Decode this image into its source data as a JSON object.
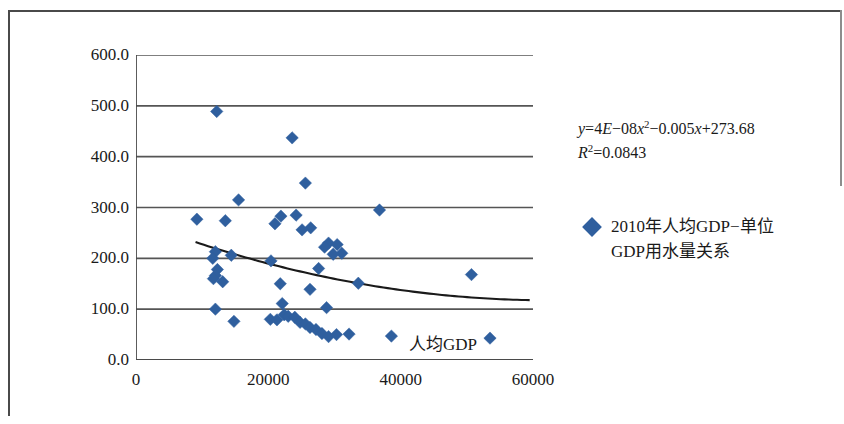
{
  "chart_data": {
    "type": "scatter",
    "title": "",
    "xlabel": "人均GDP",
    "ylabel": "单位GDP用水量/（m³/万元）",
    "xlim": [
      0,
      60000
    ],
    "ylim": [
      0,
      600
    ],
    "xticks": [
      "0",
      "20000",
      "40000",
      "60000"
    ],
    "xtick_values": [
      0,
      20000,
      40000,
      60000
    ],
    "yticks": [
      "0.0",
      "100.0",
      "200.0",
      "300.0",
      "400.0",
      "500.0",
      "600.0"
    ],
    "ytick_values": [
      0,
      100,
      200,
      300,
      400,
      500,
      600
    ],
    "grid": "horizontal",
    "legend_position": "right",
    "marker": "diamond",
    "marker_color": "#2f5f9e",
    "series": [
      {
        "name": "2010年人均GDP-单位GDP用水量关系",
        "points": [
          [
            12200,
            489
          ],
          [
            23600,
            437
          ],
          [
            25600,
            348
          ],
          [
            15500,
            315
          ],
          [
            36800,
            295
          ],
          [
            24200,
            285
          ],
          [
            21900,
            283
          ],
          [
            9200,
            277
          ],
          [
            13500,
            274
          ],
          [
            21000,
            268
          ],
          [
            26400,
            260
          ],
          [
            25100,
            256
          ],
          [
            29100,
            230
          ],
          [
            30400,
            227
          ],
          [
            28500,
            222
          ],
          [
            31100,
            210
          ],
          [
            29800,
            208
          ],
          [
            12000,
            213
          ],
          [
            11600,
            200
          ],
          [
            14400,
            206
          ],
          [
            20400,
            195
          ],
          [
            12300,
            178
          ],
          [
            12000,
            166
          ],
          [
            11700,
            160
          ],
          [
            13100,
            154
          ],
          [
            27600,
            180
          ],
          [
            50700,
            168
          ],
          [
            33600,
            151
          ],
          [
            21800,
            150
          ],
          [
            26300,
            139
          ],
          [
            12000,
            100
          ],
          [
            28800,
            103
          ],
          [
            14800,
            76
          ],
          [
            20300,
            80
          ],
          [
            21300,
            79
          ],
          [
            22400,
            89
          ],
          [
            23000,
            86
          ],
          [
            24000,
            84
          ],
          [
            24800,
            74
          ],
          [
            25600,
            71
          ],
          [
            26300,
            64
          ],
          [
            27200,
            60
          ],
          [
            28100,
            52
          ],
          [
            29100,
            46
          ],
          [
            30300,
            50
          ],
          [
            32200,
            51
          ],
          [
            38600,
            47
          ],
          [
            53500,
            43
          ],
          [
            22100,
            111
          ]
        ]
      }
    ],
    "trendline": {
      "type": "polynomial",
      "order": 2,
      "equation": "y=4E−08x²−0.005x+273.68",
      "r_squared_label": "R²=0.0843",
      "r_squared": 0.0843,
      "coefficients": [
        4e-08,
        -0.005,
        273.68
      ],
      "x_start": 9000,
      "x_end": 59500,
      "color": "#1a1a1a"
    },
    "equation_text": {
      "line1_prefix": "y",
      "line1": "y=4E−08x²−0.005x+273.68",
      "line2": "R²=0.0843"
    },
    "legend": [
      {
        "label_line1": "2010年人均GDP−单位",
        "label_line2": "GDP用水量关系",
        "marker_color": "#2f5f9e"
      }
    ]
  },
  "colors": {
    "marker": "#2f5f9e",
    "axis": "#4a4a4a",
    "grid": "#555555",
    "trendline": "#111111",
    "frame": "#4a4a4a"
  }
}
